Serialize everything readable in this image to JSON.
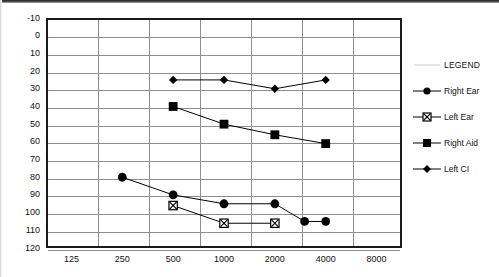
{
  "chart_data": {
    "type": "line",
    "title": "",
    "subtitle": "",
    "xlabel": "",
    "ylabel": "",
    "xscale": "log-categorical",
    "categories": [
      125,
      250,
      500,
      1000,
      2000,
      4000,
      8000
    ],
    "xtick_labels": [
      "125",
      "250",
      "500",
      "1000",
      "2000",
      "4000",
      "8000"
    ],
    "ytick_labels": [
      "-10",
      "0",
      "10",
      "20",
      "30",
      "40",
      "50",
      "60",
      "70",
      "80",
      "90",
      "100",
      "110",
      "120"
    ],
    "ylim": [
      -10,
      120
    ],
    "y_inverted": true,
    "grid": "both",
    "legend_position": "right",
    "series": [
      {
        "name": "Right Ear",
        "marker": "filled-circle",
        "color": "#000000",
        "points": [
          {
            "x": 250,
            "y": 80
          },
          {
            "x": 500,
            "y": 90
          },
          {
            "x": 1000,
            "y": 95
          },
          {
            "x": 2000,
            "y": 95
          },
          {
            "x": 3000,
            "y": 105
          },
          {
            "x": 4000,
            "y": 105
          }
        ]
      },
      {
        "name": "Left Ear",
        "marker": "square-with-x",
        "color": "#000000",
        "points": [
          {
            "x": 500,
            "y": 96
          },
          {
            "x": 1000,
            "y": 106
          },
          {
            "x": 2000,
            "y": 106
          }
        ]
      },
      {
        "name": "Right Aid",
        "marker": "filled-square",
        "color": "#000000",
        "points": [
          {
            "x": 500,
            "y": 40
          },
          {
            "x": 1000,
            "y": 50
          },
          {
            "x": 2000,
            "y": 56
          },
          {
            "x": 4000,
            "y": 61
          }
        ]
      },
      {
        "name": "Left CI",
        "marker": "filled-diamond",
        "color": "#000000",
        "points": [
          {
            "x": 500,
            "y": 25
          },
          {
            "x": 1000,
            "y": 25
          },
          {
            "x": 2000,
            "y": 30
          },
          {
            "x": 4000,
            "y": 25
          }
        ]
      }
    ]
  },
  "legend": {
    "title": "LEGEND",
    "entries": [
      {
        "label": "Right Ear",
        "marker": "filled-circle"
      },
      {
        "label": "Left Ear",
        "marker": "square-with-x"
      },
      {
        "label": "Right Aid",
        "marker": "filled-square"
      },
      {
        "label": "Left CI",
        "marker": "filled-diamond"
      }
    ]
  }
}
